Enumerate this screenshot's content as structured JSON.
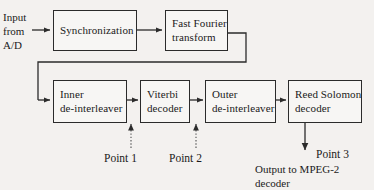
{
  "diagram": {
    "background_color": "#f3f1ef",
    "line_color": "#2b2b2b",
    "box_fill": "#f7f6f4"
  },
  "input_label": {
    "line1": "Input",
    "line2": "from",
    "line3": "A/D"
  },
  "blocks": [
    {
      "id": "synchronization",
      "line1": "Synchronization",
      "line2": ""
    },
    {
      "id": "fast-fourier-transform",
      "line1": "Fast Fourier",
      "line2": "transform"
    },
    {
      "id": "inner-de-interleaver",
      "line1": "Inner",
      "line2": "de-interleaver"
    },
    {
      "id": "viterbi-decoder",
      "line1": "Viterbi",
      "line2": "decoder"
    },
    {
      "id": "outer-de-interleaver",
      "line1": "Outer",
      "line2": "de-interleaver"
    },
    {
      "id": "reed-solomon-decoder",
      "line1": "Reed Solomon",
      "line2": "decoder"
    }
  ],
  "probe_points": [
    {
      "id": "point-1",
      "label": "Point 1"
    },
    {
      "id": "point-2",
      "label": "Point 2"
    },
    {
      "id": "point-3",
      "label": "Point 3"
    }
  ],
  "output_label": {
    "line1": "Output to MPEG-2",
    "line2": "decoder"
  }
}
